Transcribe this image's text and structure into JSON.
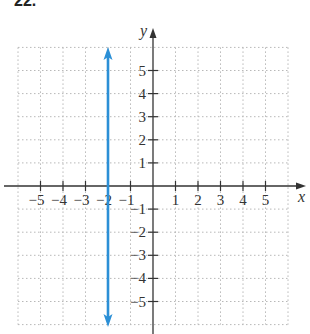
{
  "problem": {
    "number": "22."
  },
  "chart_data": {
    "type": "line",
    "title": "",
    "xlabel": "x",
    "ylabel": "y",
    "xlim": [
      -6,
      6
    ],
    "ylim": [
      -6,
      6
    ],
    "grid": true,
    "grid_style": "dotted",
    "x_ticks": [
      -5,
      -4,
      -3,
      -2,
      -1,
      1,
      2,
      3,
      4,
      5
    ],
    "y_ticks": [
      5,
      4,
      3,
      2,
      1,
      -1,
      -2,
      -3,
      -4,
      -5
    ],
    "x_tick_labels": [
      "−5",
      "−4",
      "−3",
      "−2",
      "−1",
      "1",
      "2",
      "3",
      "4",
      "5"
    ],
    "y_tick_labels": [
      "5",
      "4",
      "3",
      "2",
      "1",
      "−1",
      "−2",
      "−3",
      "−4",
      "−5"
    ],
    "series": [
      {
        "name": "x = -2",
        "kind": "vertical line with arrows at both ends",
        "x": [
          -2,
          -2
        ],
        "y": [
          -6,
          6
        ],
        "color": "#2b8fd6"
      }
    ]
  },
  "colors": {
    "line": "#2b8fd6",
    "axis": "#333333",
    "grid": "#b8b8b8"
  }
}
